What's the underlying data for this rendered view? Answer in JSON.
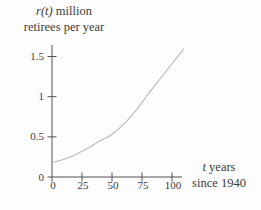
{
  "figure": {
    "y_title": {
      "var": "r(t)",
      "rest": " million",
      "line2": "retirees per year"
    },
    "x_title": {
      "var": "t",
      "rest": " years",
      "line2": "since 1940"
    }
  },
  "chart_data": {
    "type": "line",
    "title": "",
    "ylabel": "r(t) million retirees per year",
    "xlabel": "t years since 1940",
    "x_ticks": [
      0,
      25,
      50,
      75,
      100
    ],
    "y_ticks": [
      0,
      0.5,
      1,
      1.5
    ],
    "xlim": [
      0,
      110
    ],
    "ylim": [
      0,
      1.68
    ],
    "grid": false,
    "legend": false,
    "series": [
      {
        "name": "retirees per year",
        "x": [
          0,
          10,
          20,
          30,
          40,
          50,
          60,
          70,
          80,
          90,
          100,
          110
        ],
        "y": [
          0.18,
          0.22,
          0.28,
          0.36,
          0.45,
          0.53,
          0.66,
          0.83,
          1.03,
          1.22,
          1.41,
          1.6
        ]
      }
    ],
    "colors": {
      "curve": "#bababa",
      "axis": "#525252",
      "text": "#3b3b3b"
    }
  }
}
